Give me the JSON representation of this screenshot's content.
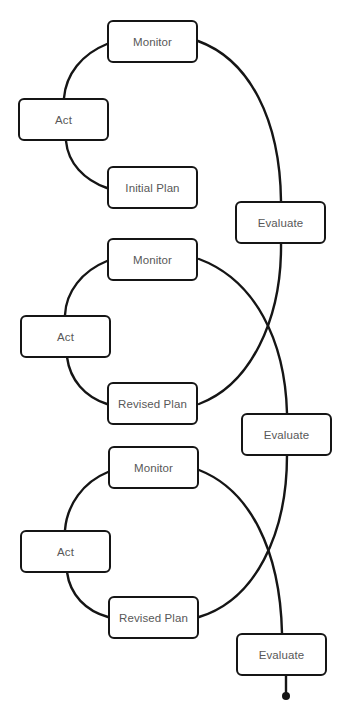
{
  "diagram": {
    "type": "iterative-cycle-flow",
    "colors": {
      "stroke": "#151515",
      "label": "#585858",
      "background": "#ffffff"
    },
    "cycles": [
      {
        "name": "cycle-1",
        "nodes": {
          "monitor": "Monitor",
          "act": "Act",
          "plan": "Initial Plan",
          "evaluate": "Evaluate"
        }
      },
      {
        "name": "cycle-2",
        "nodes": {
          "monitor": "Monitor",
          "act": "Act",
          "plan": "Revised Plan",
          "evaluate": "Evaluate"
        }
      },
      {
        "name": "cycle-3",
        "nodes": {
          "monitor": "Monitor",
          "act": "Act",
          "plan": "Revised Plan",
          "evaluate": "Evaluate"
        }
      }
    ],
    "flow": [
      "Initial Plan → Act → Monitor → Evaluate",
      "Evaluate → Revised Plan → Act → Monitor → Evaluate",
      "Evaluate → Revised Plan → Act → Monitor → Evaluate → end"
    ]
  }
}
